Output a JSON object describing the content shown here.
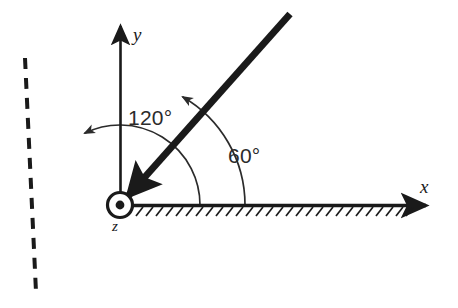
{
  "figure": {
    "type": "engineering-mechanics-diagram",
    "background_color": "#ffffff",
    "ink_color": "#1a1a1a"
  },
  "axes": {
    "x": {
      "label": "x",
      "origin": [
        120,
        205
      ],
      "tip": [
        432,
        205
      ],
      "style": "solid-arrow",
      "hatched": true,
      "hatch_side": "below"
    },
    "y": {
      "label": "y",
      "origin": [
        120,
        205
      ],
      "tip": [
        121,
        22
      ],
      "style": "solid-arrow"
    },
    "z": {
      "label": "z",
      "symbol": "circle-with-dot",
      "meaning": "out-of-page",
      "center": [
        120,
        205
      ],
      "outer_radius": 13,
      "dot_radius": 4.5
    }
  },
  "members": {
    "bar": {
      "name": "thick-bar",
      "from": [
        120,
        205
      ],
      "to": [
        290,
        14
      ],
      "angle_deg": 60,
      "stroke_width": 7,
      "arrowhead": "at-origin-end"
    },
    "dashed_line": {
      "name": "dashed-reference-line",
      "from": [
        25,
        58
      ],
      "to": [
        36,
        292
      ],
      "through": [
        120,
        205
      ],
      "angle_deg": 120,
      "style": "dashed",
      "stroke_width": 4,
      "dash": "11 9"
    }
  },
  "angles": [
    {
      "id": "angle-120",
      "label": "120°",
      "value": 120,
      "unit": "degrees",
      "from_axis": "x",
      "to": "dashed-reference-line",
      "arc_radius": 80,
      "arrow_at": "dashed-line-end",
      "label_pos": [
        128,
        107
      ]
    },
    {
      "id": "angle-60",
      "label": "60°",
      "value": 60,
      "unit": "degrees",
      "from_axis": "x",
      "to": "thick-bar",
      "arc_radius": 125,
      "arrow_at": "bar-end",
      "label_pos": [
        228,
        145
      ]
    }
  ],
  "labels": {
    "y_axis": "y",
    "x_axis": "x",
    "z_axis": "z",
    "angle_120": "120°",
    "angle_60": "60°"
  }
}
